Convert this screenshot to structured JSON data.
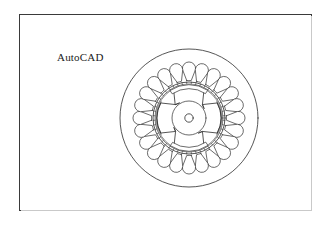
{
  "page": {
    "background_color": "#ffffff",
    "width": 330,
    "height": 225
  },
  "drawing_frame": {
    "name": "drawing-border",
    "border_color": "#3a3a3a",
    "shadow_color": "#c9c9c9",
    "x": 19,
    "y": 14,
    "width": 293,
    "height": 197
  },
  "label": {
    "text": "AutoCAD",
    "color": "#1a1a1a",
    "font_size": "11px"
  },
  "diagram": {
    "title": "AutoCAD",
    "line_color": "#2b2b2b",
    "fill_color": "#ffffff",
    "center_x": 75,
    "center_y": 75,
    "stator_outer_radius": 69,
    "stator_slot_count": 24,
    "stator_slot_body_radius": 6.6,
    "stator_slot_center_radius": 49,
    "stator_slot_neck_inner_radius": 37.5,
    "stator_bore_radius": 36,
    "stator_tooth_tip_radius": 34,
    "stator_inner_tooth_count": 48,
    "airgap_radius": 33,
    "rotor_outer_radius": 32,
    "rotor_pole_count": 4,
    "rotor_pole_arc_degrees": 56,
    "rotor_pole_root_radius": 19,
    "rotor_hub_radius": 17,
    "rotor_shaft_radius": 4.2,
    "rotor_arc_band_inner_radius": 27,
    "rotor_arc_band_outer_radius": 31
  }
}
